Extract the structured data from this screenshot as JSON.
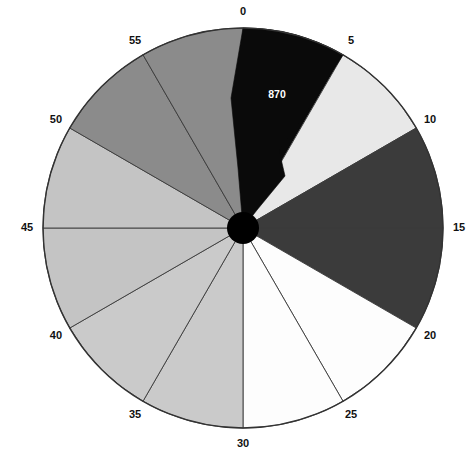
{
  "figure": {
    "background_color": "#ffffff",
    "outline_color": "#333333",
    "hub_color": "#000000",
    "value_label_color": "#ffffff",
    "tick_label_color": "#111111"
  },
  "geometry": {
    "center_x": 243,
    "center_y": 228,
    "radius": 200,
    "hub_radius": 16,
    "tick_label_radius": 216
  },
  "chart_data": {
    "type": "pie",
    "title": "",
    "subtitle": "",
    "xlabel": "",
    "ylabel": "",
    "legend_position": "none",
    "grid": false,
    "start_angle_deg": 0,
    "direction": "clockwise",
    "axis_tick_labels": [
      "0",
      "5",
      "10",
      "15",
      "20",
      "25",
      "30",
      "35",
      "40",
      "45",
      "50",
      "55"
    ],
    "axis_tick_values": [
      0,
      5,
      10,
      15,
      20,
      25,
      30,
      35,
      40,
      45,
      50,
      55
    ],
    "axis_units_per_revolution": 60,
    "categories": [
      "0-5",
      "5-10",
      "10-15",
      "15-20",
      "20-25",
      "25-30",
      "30-35",
      "35-40",
      "40-45",
      "45-50",
      "50-55",
      "55-60"
    ],
    "values": [
      5,
      5,
      5,
      5,
      5,
      5,
      5,
      5,
      5,
      5,
      5,
      5
    ],
    "sectors": [
      {
        "label": "0-5",
        "start": 0,
        "end": 5,
        "color": "#0a0a0a",
        "value_label": "870"
      },
      {
        "label": "5-10",
        "start": 5,
        "end": 10,
        "color": "#e8e8e8",
        "value_label": ""
      },
      {
        "label": "10-15",
        "start": 10,
        "end": 15,
        "color": "#3b3b3b",
        "value_label": ""
      },
      {
        "label": "15-20",
        "start": 15,
        "end": 20,
        "color": "#3b3b3b",
        "value_label": ""
      },
      {
        "label": "20-25",
        "start": 20,
        "end": 25,
        "color": "#fdfdfd",
        "value_label": ""
      },
      {
        "label": "25-30",
        "start": 25,
        "end": 30,
        "color": "#fdfdfd",
        "value_label": ""
      },
      {
        "label": "30-35",
        "start": 30,
        "end": 35,
        "color": "#cacaca",
        "value_label": ""
      },
      {
        "label": "35-40",
        "start": 35,
        "end": 40,
        "color": "#cacaca",
        "value_label": ""
      },
      {
        "label": "40-45",
        "start": 40,
        "end": 45,
        "color": "#c4c4c4",
        "value_label": ""
      },
      {
        "label": "45-50",
        "start": 45,
        "end": 50,
        "color": "#c4c4c4",
        "value_label": ""
      },
      {
        "label": "50-55",
        "start": 50,
        "end": 55,
        "color": "#8b8b8b",
        "value_label": ""
      },
      {
        "label": "55-60",
        "start": 55,
        "end": 60,
        "color": "#8b8b8b",
        "value_label": ""
      }
    ],
    "data_labels": [
      {
        "text": "870",
        "sector": "0-5",
        "x": 277,
        "y": 95
      }
    ],
    "notch": {
      "description": "black 0-5 sector extends past its boundary with a stepped inner notch toward the hub",
      "present": true
    }
  },
  "footer": {
    "caption": ""
  }
}
